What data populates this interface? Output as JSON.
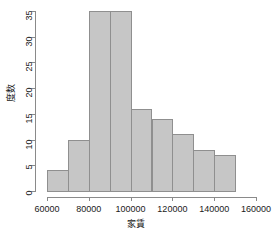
{
  "chart_data": {
    "type": "bar",
    "title": "",
    "subtitle": "",
    "xlabel": "家賃",
    "ylabel": "度数",
    "xlim": [
      60000,
      160000
    ],
    "ylim": [
      0,
      35
    ],
    "grid": false,
    "legend": null,
    "bin_width": 10000,
    "bin_edges": [
      60000,
      70000,
      80000,
      90000,
      100000,
      110000,
      120000,
      130000,
      140000,
      150000
    ],
    "categories": [
      "60000-70000",
      "70000-80000",
      "80000-90000",
      "90000-100000",
      "100000-110000",
      "110000-120000",
      "120000-130000",
      "130000-140000",
      "140000-150000"
    ],
    "values": [
      4,
      10,
      35,
      35,
      16,
      14,
      11,
      8,
      7
    ],
    "x_tick_labels": [
      "60000",
      "80000",
      "100000",
      "120000",
      "140000",
      "160000"
    ],
    "x_tick_values": [
      60000,
      80000,
      100000,
      120000,
      140000,
      160000
    ],
    "y_tick_labels": [
      "0",
      "5",
      "10",
      "15",
      "20",
      "25",
      "30",
      "35"
    ],
    "y_tick_values": [
      0,
      5,
      10,
      15,
      20,
      25,
      30,
      35
    ],
    "bar_fill_color": "#c6c6c6",
    "bar_border_color": "#8f8f8f",
    "axis_color": "#8a8a8a",
    "text_color": "#1a1a1a",
    "background_color": "#ffffff"
  }
}
